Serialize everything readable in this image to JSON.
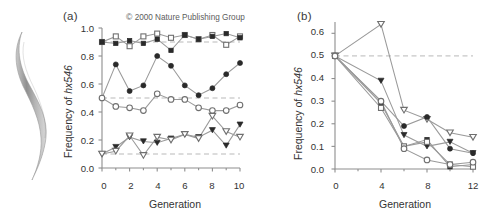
{
  "figure": {
    "copyright": "2000 Nature Publishing Group",
    "copyright_mark": "©",
    "organism_illustration": "nematode-worm"
  },
  "panels": {
    "a": {
      "label": "(a)"
    },
    "b": {
      "label": "(b)"
    }
  },
  "chart_data": [
    {
      "id": "panel-a",
      "type": "line",
      "title": "(a)",
      "xlabel": "Generation",
      "ylabel": "Frequency of hx546",
      "ylabel_plain": "Frequency of ",
      "ylabel_italic": "hx546",
      "xlim": [
        0,
        10
      ],
      "ylim": [
        0.0,
        1.0
      ],
      "xticks": [
        0,
        2,
        4,
        6,
        8,
        10
      ],
      "xticklabels": [
        "0",
        "2",
        "4",
        "6",
        "8",
        "10"
      ],
      "xminorticks": [
        1,
        3,
        5,
        7,
        9
      ],
      "yticks": [
        0.0,
        0.2,
        0.4,
        0.6,
        0.8,
        1.0
      ],
      "yticklabels": [
        "0.0",
        "0.2",
        "0.4",
        "0.6",
        "0.8",
        "1.0"
      ],
      "grid": false,
      "legend": "none",
      "reference_lines": [
        {
          "y": 0.9,
          "style": "dashed"
        },
        {
          "y": 0.5,
          "style": "dashed"
        },
        {
          "y": 0.1,
          "style": "dashed"
        }
      ],
      "x": [
        0,
        1,
        2,
        3,
        4,
        5,
        6,
        7,
        8,
        9,
        10
      ],
      "series": [
        {
          "name": "open-square",
          "marker": "square-open",
          "values": [
            0.9,
            0.94,
            0.87,
            0.94,
            0.96,
            0.93,
            0.95,
            0.92,
            0.95,
            0.88,
            0.94
          ]
        },
        {
          "name": "filled-square",
          "marker": "square-filled",
          "values": [
            0.9,
            0.89,
            0.91,
            0.89,
            0.92,
            0.84,
            0.95,
            0.92,
            0.94,
            0.96,
            0.93
          ]
        },
        {
          "name": "filled-circle",
          "marker": "circle-filled",
          "values": [
            0.5,
            0.74,
            0.55,
            0.59,
            0.8,
            0.73,
            0.59,
            0.52,
            0.57,
            0.67,
            0.75
          ]
        },
        {
          "name": "open-circle",
          "marker": "circle-open",
          "values": [
            0.5,
            0.44,
            0.43,
            0.41,
            0.53,
            0.49,
            0.49,
            0.43,
            0.41,
            0.41,
            0.45
          ]
        },
        {
          "name": "filled-triangle",
          "marker": "triangle-down-filled",
          "values": [
            0.1,
            0.15,
            0.22,
            0.19,
            0.18,
            0.21,
            0.24,
            0.22,
            0.27,
            0.16,
            0.31
          ]
        },
        {
          "name": "open-triangle",
          "marker": "triangle-down-open",
          "values": [
            0.1,
            0.12,
            0.23,
            0.09,
            0.22,
            0.2,
            0.24,
            0.21,
            0.37,
            0.26,
            0.22
          ]
        }
      ]
    },
    {
      "id": "panel-b",
      "type": "line",
      "title": "(b)",
      "xlabel": "Generation",
      "ylabel": "Frequency of hx546",
      "ylabel_plain": "Frequency of ",
      "ylabel_italic": "hx546",
      "xlim": [
        0,
        12
      ],
      "ylim": [
        0.0,
        0.65
      ],
      "xticks": [
        0,
        4,
        8,
        12
      ],
      "xticklabels": [
        "0",
        "4",
        "8",
        "12"
      ],
      "xminorticks": [
        2,
        6,
        10
      ],
      "yticks": [
        0.0,
        0.1,
        0.2,
        0.3,
        0.4,
        0.5,
        0.6
      ],
      "yticklabels": [
        "0.0",
        "0.1",
        "0.2",
        "0.3",
        "0.4",
        "0.5",
        "0.6"
      ],
      "grid": false,
      "legend": "none",
      "reference_lines": [
        {
          "y": 0.5,
          "style": "dashed"
        }
      ],
      "x": [
        0,
        4,
        6,
        8,
        10,
        12
      ],
      "series": [
        {
          "name": "open-triangle",
          "marker": "triangle-down-open",
          "values": [
            0.5,
            0.64,
            0.26,
            0.22,
            0.16,
            0.14
          ]
        },
        {
          "name": "filled-triangle",
          "marker": "triangle-down-filled",
          "values": [
            0.5,
            0.39,
            0.15,
            0.1,
            0.12,
            0.07
          ]
        },
        {
          "name": "filled-circle",
          "marker": "circle-filled",
          "values": [
            0.5,
            0.3,
            0.19,
            0.23,
            0.09,
            0.07
          ]
        },
        {
          "name": "filled-square",
          "marker": "square-filled",
          "values": [
            0.5,
            0.29,
            0.1,
            0.13,
            0.01,
            0.02
          ]
        },
        {
          "name": "open-square",
          "marker": "square-open",
          "values": [
            0.5,
            0.27,
            0.1,
            0.12,
            0.02,
            0.01
          ]
        },
        {
          "name": "open-circle",
          "marker": "circle-open",
          "values": [
            0.5,
            0.3,
            0.09,
            0.04,
            0.02,
            0.03
          ]
        }
      ]
    }
  ]
}
